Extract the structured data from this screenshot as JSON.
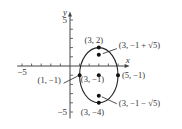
{
  "chart_data": {
    "type": "scatter",
    "title": "",
    "xlabel": "x",
    "ylabel": "y",
    "xlim": [
      -5,
      5
    ],
    "ylim": [
      -5,
      5
    ],
    "x_tick_labels": [
      "-5"
    ],
    "y_tick_labels": [
      "5",
      "-5"
    ],
    "curve": {
      "type": "ellipse",
      "center": [
        3,
        -1
      ],
      "rx": 2,
      "ry": 3
    },
    "points": [
      {
        "x": 3,
        "y": 2,
        "label": "(3, 2)"
      },
      {
        "x": 3,
        "y": 1.236,
        "label": "(3, −1 + √5)"
      },
      {
        "x": 1,
        "y": -1,
        "label": "(1, −1)"
      },
      {
        "x": 3,
        "y": -1,
        "label": "(3, −1)"
      },
      {
        "x": 5,
        "y": -1,
        "label": "(5, −1)"
      },
      {
        "x": 3,
        "y": -3.236,
        "label": "(3, −1 − √5)"
      },
      {
        "x": 3,
        "y": -4,
        "label": "(3, −4)"
      }
    ]
  }
}
